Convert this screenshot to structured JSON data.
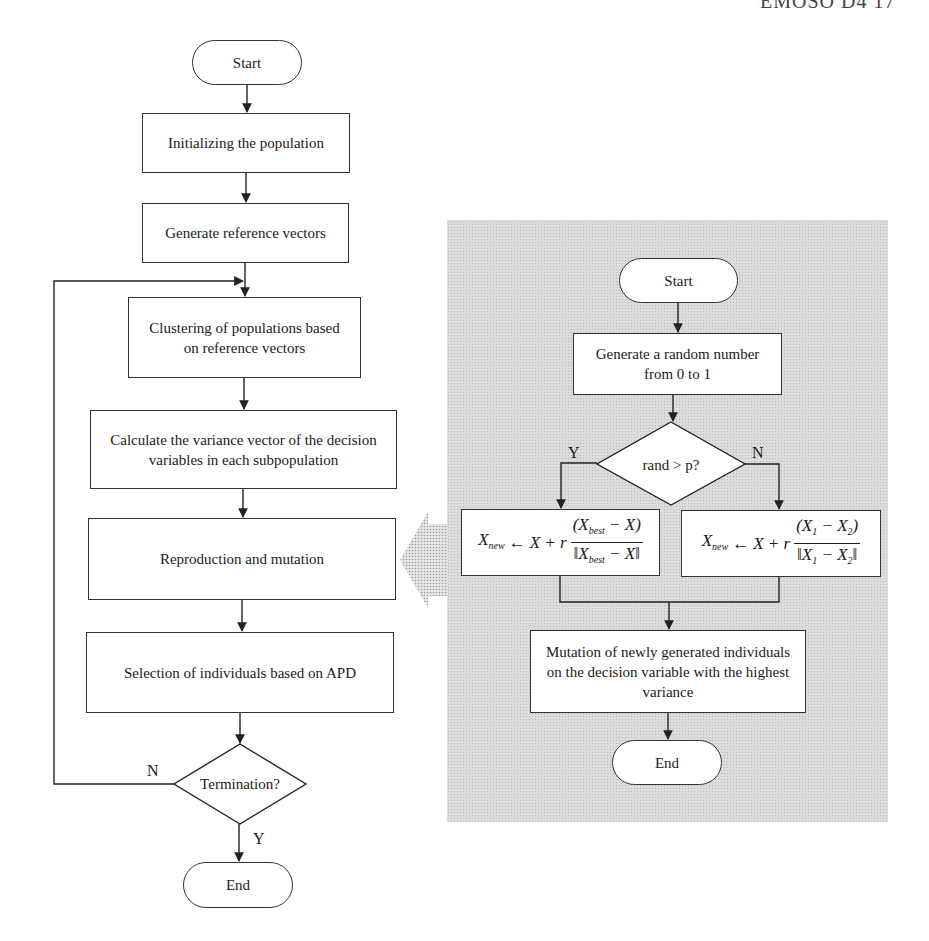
{
  "header": {
    "fragment": "EMOSO D4   17"
  },
  "left_flowchart": {
    "start": "Start",
    "steps": [
      "Initializing the population",
      "Generate reference vectors",
      "Clustering of populations based on reference vectors",
      "Calculate the variance vector of the decision variables in each subpopulation",
      "Reproduction and mutation",
      "Selection of individuals based on APD"
    ],
    "decision": "Termination?",
    "no_label": "N",
    "yes_label": "Y",
    "end": "End"
  },
  "right_flowchart": {
    "start": "Start",
    "step_random": "Generate a random number from 0 to 1",
    "decision": "rand > p?",
    "yes_label": "Y",
    "no_label": "N",
    "formula_yes": {
      "lhs": "X",
      "lhs_sub": "new",
      "arrow": "←",
      "mid": "X + r",
      "num": "(X",
      "num_sub": "best",
      "num_tail": " − X)",
      "den": "‖X",
      "den_sub": "best",
      "den_tail": " − X‖"
    },
    "formula_no": {
      "lhs": "X",
      "lhs_sub": "new",
      "arrow": "←",
      "mid": "X + r",
      "num": "(X",
      "num_sub": "1",
      "num_tail": " − X",
      "num_sub2": "2",
      "num_end": ")",
      "den": "‖X",
      "den_sub": "1",
      "den_tail": " − X",
      "den_sub2": "2",
      "den_end": "‖"
    },
    "step_mutation": "Mutation of newly generated individuals on the decision variable with the highest variance",
    "end": "End"
  },
  "colors": {
    "line": "#333333",
    "panel_bg": "#dcdcdc",
    "box_bg": "#ffffff"
  }
}
